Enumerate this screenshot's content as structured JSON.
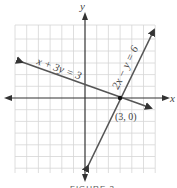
{
  "figure": {
    "axes": {
      "x_label": "x",
      "y_label": "y"
    },
    "lines": [
      {
        "equation": "x + 3y = 3",
        "label": "x + 3y = 3"
      },
      {
        "equation": "2x − y = 6",
        "label": "2x − y = 6"
      }
    ],
    "intersection": {
      "label": "(3, 0)",
      "x": 3,
      "y": 0
    },
    "caption": "FIGURE 3"
  },
  "colors": {
    "grid": "#d6d6d6",
    "axis": "#333333",
    "line": "#555555",
    "text": "#444444"
  }
}
